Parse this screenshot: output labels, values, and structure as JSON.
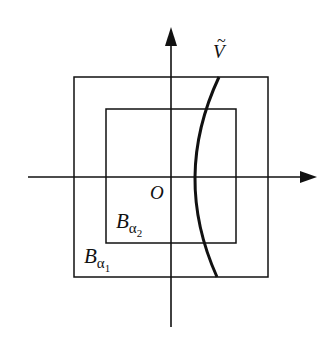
{
  "diagram": {
    "colors": {
      "stroke": "#111111",
      "background": "#ffffff"
    },
    "axes": {
      "horizontal": {
        "x1": 28,
        "x2": 316,
        "y": 177
      },
      "vertical": {
        "x": 171,
        "y1": 327,
        "y2": 27
      }
    },
    "outer_square": {
      "x": 74,
      "y": 77,
      "width": 194,
      "height": 200
    },
    "inner_square": {
      "x": 106,
      "y": 109,
      "width": 130,
      "height": 134
    },
    "curve": {
      "start": [
        219,
        77
      ],
      "control": [
        172,
        177
      ],
      "end": [
        217,
        277
      ]
    },
    "labels": {
      "curve_label": "V",
      "curve_label_accent": "~",
      "origin": "O",
      "inner_set_base": "B",
      "inner_set_sub": "α",
      "inner_set_subsub": "2",
      "outer_set_base": "B",
      "outer_set_sub": "α",
      "outer_set_subsub": "1"
    }
  }
}
